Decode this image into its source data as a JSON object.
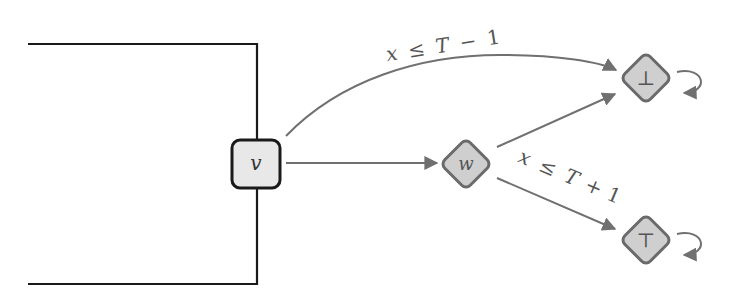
{
  "diagram": {
    "colors": {
      "box_stroke": "#1a1a1a",
      "box_fill": "#e8e8e8",
      "diamond_stroke": "#6a6a6a",
      "diamond_fill": "#cfcfcf",
      "edge": "#707070",
      "text": "#555555"
    },
    "nodes": {
      "v": {
        "label": "v",
        "shape": "rounded-square"
      },
      "w": {
        "label": "w",
        "shape": "diamond"
      },
      "bottom": {
        "label": "⊥",
        "shape": "diamond",
        "self_loop": true
      },
      "top": {
        "label": "⊤",
        "shape": "diamond",
        "self_loop": true
      }
    },
    "edges": [
      {
        "from": "v",
        "to": "bottom",
        "label": "x ≤ T − 1",
        "curved": true
      },
      {
        "from": "v",
        "to": "w",
        "label": ""
      },
      {
        "from": "w",
        "to": "bottom",
        "label": ""
      },
      {
        "from": "w",
        "to": "top",
        "label": "x ≤ T + 1"
      }
    ],
    "edge_labels": {
      "upper": {
        "x": "x",
        "le": "≤",
        "T": "T",
        "op": "−",
        "n": "1"
      },
      "lower": {
        "x": "x",
        "le": "≤",
        "T": "T",
        "op": "+",
        "n": "1"
      }
    }
  }
}
